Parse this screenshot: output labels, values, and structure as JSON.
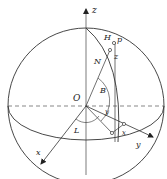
{
  "diagram": {
    "stroke_color": "#333333",
    "labels": {
      "z_axis": "z",
      "x_axis": "x",
      "y_axis": "y",
      "origin": "O",
      "point_H": "H",
      "point_p": "p",
      "point_z": "z",
      "line_N": "N",
      "angle_B": "B",
      "angle_L": "L",
      "angle_y": "y",
      "segment_x": "x"
    }
  }
}
